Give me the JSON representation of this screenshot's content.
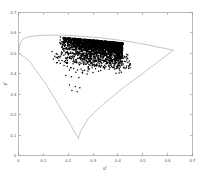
{
  "chart_data": {
    "type": "scatter",
    "title": "",
    "xlabel": "u'",
    "ylabel": "v'",
    "xlim": [
      0,
      0.7
    ],
    "ylim": [
      0,
      0.7
    ],
    "grid": false,
    "legend": null,
    "xticks": [
      "0",
      "0.1",
      "0.2",
      "0.3",
      "0.4",
      "0.5",
      "0.6",
      "0.7"
    ],
    "xtick_values": [
      0,
      0.1,
      0.2,
      0.3,
      0.4,
      0.5,
      0.6,
      0.7
    ],
    "yticks": [
      "0",
      "0.1",
      "0.2",
      "0.3",
      "0.4",
      "0.5",
      "0.6",
      "0.7"
    ],
    "ytick_values": [
      0,
      0.1,
      0.2,
      0.3,
      0.4,
      0.5,
      0.6,
      0.7
    ],
    "series": [
      {
        "name": "spectral-locus",
        "type": "line",
        "color": "#a0a0a0",
        "closed": true,
        "points": [
          [
            0.0,
            0.5
          ],
          [
            0.004,
            0.535
          ],
          [
            0.009,
            0.555
          ],
          [
            0.015,
            0.566
          ],
          [
            0.023,
            0.573
          ],
          [
            0.035,
            0.579
          ],
          [
            0.05,
            0.583
          ],
          [
            0.07,
            0.586
          ],
          [
            0.092,
            0.588
          ],
          [
            0.115,
            0.589
          ],
          [
            0.14,
            0.5895
          ],
          [
            0.17,
            0.589
          ],
          [
            0.2,
            0.588
          ],
          [
            0.23,
            0.586
          ],
          [
            0.26,
            0.583
          ],
          [
            0.295,
            0.58
          ],
          [
            0.33,
            0.576
          ],
          [
            0.37,
            0.57
          ],
          [
            0.41,
            0.564
          ],
          [
            0.45,
            0.557
          ],
          [
            0.49,
            0.548
          ],
          [
            0.53,
            0.539
          ],
          [
            0.56,
            0.531
          ],
          [
            0.59,
            0.524
          ],
          [
            0.61,
            0.519
          ],
          [
            0.623,
            0.516
          ],
          [
            0.623,
            0.516
          ],
          [
            0.52,
            0.42
          ],
          [
            0.42,
            0.33
          ],
          [
            0.34,
            0.25
          ],
          [
            0.28,
            0.18
          ],
          [
            0.25,
            0.12
          ],
          [
            0.24,
            0.084
          ],
          [
            0.243,
            0.083
          ],
          [
            0.23,
            0.105
          ],
          [
            0.21,
            0.15
          ],
          [
            0.18,
            0.21
          ],
          [
            0.145,
            0.28
          ],
          [
            0.11,
            0.35
          ],
          [
            0.075,
            0.41
          ],
          [
            0.045,
            0.46
          ],
          [
            0.022,
            0.484
          ],
          [
            0.008,
            0.494
          ],
          [
            0.0,
            0.5
          ]
        ]
      },
      {
        "name": "measured-chromaticities",
        "type": "scatter",
        "color": "#000000",
        "marker": "dot",
        "marker_size": 0.75,
        "count": 2400,
        "cluster": {
          "u_range": [
            0.13,
            0.455
          ],
          "v_range": [
            0.4,
            0.565
          ],
          "dense_u_range": [
            0.165,
            0.42
          ],
          "dense_v_range": [
            0.48,
            0.558
          ],
          "centroid": [
            0.265,
            0.525
          ]
        },
        "outliers": [
          [
            0.168,
            0.452
          ],
          [
            0.183,
            0.441
          ],
          [
            0.196,
            0.437
          ],
          [
            0.21,
            0.43
          ],
          [
            0.222,
            0.426
          ],
          [
            0.205,
            0.418
          ],
          [
            0.238,
            0.419
          ],
          [
            0.252,
            0.424
          ],
          [
            0.266,
            0.417
          ],
          [
            0.281,
            0.423
          ],
          [
            0.296,
            0.43
          ],
          [
            0.31,
            0.425
          ],
          [
            0.231,
            0.408
          ],
          [
            0.258,
            0.404
          ],
          [
            0.276,
            0.399
          ],
          [
            0.3,
            0.406
          ],
          [
            0.322,
            0.412
          ],
          [
            0.19,
            0.392
          ],
          [
            0.213,
            0.386
          ],
          [
            0.243,
            0.381
          ],
          [
            0.205,
            0.345
          ],
          [
            0.228,
            0.338
          ],
          [
            0.247,
            0.332
          ],
          [
            0.215,
            0.318
          ],
          [
            0.236,
            0.312
          ],
          [
            0.152,
            0.498
          ],
          [
            0.146,
            0.486
          ],
          [
            0.14,
            0.472
          ],
          [
            0.135,
            0.509
          ]
        ]
      }
    ]
  }
}
